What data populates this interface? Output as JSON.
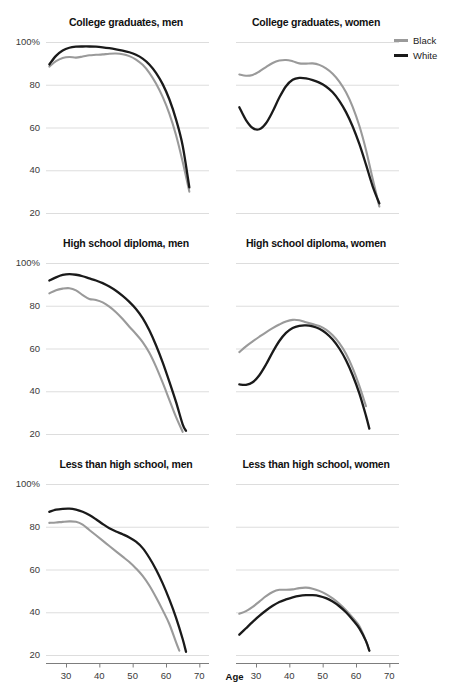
{
  "figure": {
    "xaxis_title": "Age",
    "legend": {
      "items": [
        {
          "label": "Black",
          "color": "#9a9a9a"
        },
        {
          "label": "White",
          "color": "#1a1a1a"
        }
      ]
    }
  },
  "chart_data": {
    "type": "line",
    "xlabel": "Age",
    "ylabel": "",
    "xlim": [
      24,
      72
    ],
    "ylim": [
      20,
      100
    ],
    "xticks": [
      30,
      40,
      50,
      60,
      70
    ],
    "xticklabels": [
      "30",
      "40",
      "50",
      "60",
      "70"
    ],
    "yticks": [
      20,
      40,
      60,
      80,
      100
    ],
    "yticklabels": [
      "20",
      "40",
      "60",
      "80",
      "100%"
    ],
    "grid": true,
    "legend_position": "top-right",
    "legend_entries": [
      "Black",
      "White"
    ],
    "colors": {
      "Black": "#9a9a9a",
      "White": "#1a1a1a"
    },
    "panel_layout": {
      "rows": 3,
      "cols": 2
    },
    "panels": [
      {
        "title": "College graduates, men",
        "row": 0,
        "col": 0,
        "series": [
          {
            "name": "Black",
            "x": [
              25,
              27,
              29,
              31,
              33,
              35,
              37,
              39,
              41,
              43,
              45,
              47,
              49,
              51,
              53,
              55,
              57,
              59,
              61,
              63,
              65,
              67
            ],
            "y": [
              88.5,
              91.0,
              92.5,
              93.0,
              92.7,
              93.2,
              93.8,
              94.0,
              94.2,
              94.5,
              94.6,
              94.3,
              93.4,
              91.8,
              89.3,
              85.6,
              80.6,
              74.3,
              66.5,
              56.5,
              44.0,
              30.0
            ]
          },
          {
            "name": "White",
            "x": [
              25,
              27,
              29,
              31,
              33,
              35,
              37,
              39,
              41,
              43,
              45,
              47,
              49,
              51,
              53,
              55,
              57,
              59,
              61,
              63,
              65,
              67
            ],
            "y": [
              89.5,
              93.5,
              96.0,
              97.3,
              97.8,
              97.9,
              97.9,
              97.8,
              97.5,
              97.1,
              96.6,
              96.0,
              95.2,
              94.0,
              92.2,
              89.5,
              85.6,
              80.3,
              73.2,
              63.8,
              51.5,
              32.0
            ]
          }
        ]
      },
      {
        "title": "College graduates, women",
        "row": 0,
        "col": 1,
        "series": [
          {
            "name": "Black",
            "x": [
              25,
              27,
              29,
              31,
              33,
              35,
              37,
              39,
              41,
              43,
              45,
              47,
              49,
              51,
              53,
              55,
              57,
              59,
              61,
              63,
              65,
              67
            ],
            "y": [
              84.8,
              84.2,
              84.6,
              86.2,
              88.3,
              90.2,
              91.3,
              91.6,
              91.0,
              90.0,
              89.9,
              90.0,
              89.3,
              87.7,
              85.2,
              81.5,
              76.5,
              69.7,
              60.8,
              49.5,
              36.0,
              23.0
            ]
          },
          {
            "name": "White",
            "x": [
              25,
              27,
              29,
              31,
              33,
              35,
              37,
              39,
              41,
              43,
              45,
              47,
              49,
              51,
              53,
              55,
              57,
              59,
              61,
              63,
              65,
              67
            ],
            "y": [
              69.5,
              63.5,
              59.8,
              59.2,
              62.0,
              67.5,
              74.0,
              79.3,
              82.3,
              83.2,
              83.0,
              82.2,
              81.0,
              79.2,
              76.5,
              72.5,
              67.2,
              60.5,
              52.3,
              42.6,
              32.5,
              24.5
            ]
          }
        ]
      },
      {
        "title": "High school diploma, men",
        "row": 1,
        "col": 0,
        "series": [
          {
            "name": "Black",
            "x": [
              25,
              27,
              29,
              31,
              33,
              35,
              37,
              39,
              41,
              43,
              45,
              47,
              49,
              51,
              53,
              55,
              57,
              59,
              61,
              63,
              65
            ],
            "y": [
              85.8,
              87.3,
              88.0,
              88.2,
              87.2,
              85.0,
              83.2,
              82.7,
              81.6,
              79.6,
              77.0,
              73.8,
              70.2,
              66.8,
              63.0,
              58.0,
              51.5,
              44.0,
              36.0,
              28.0,
              21.0
            ]
          },
          {
            "name": "White",
            "x": [
              25,
              27,
              29,
              31,
              33,
              35,
              37,
              39,
              41,
              43,
              45,
              47,
              49,
              51,
              53,
              55,
              57,
              59,
              61,
              63,
              65,
              66
            ],
            "y": [
              91.8,
              93.3,
              94.4,
              94.8,
              94.5,
              93.8,
              92.8,
              91.8,
              90.6,
              89.0,
              87.0,
              84.6,
              81.8,
              78.5,
              74.2,
              68.5,
              61.5,
              53.5,
              44.5,
              35.0,
              24.5,
              21.5
            ]
          }
        ]
      },
      {
        "title": "High school diploma, women",
        "row": 1,
        "col": 1,
        "series": [
          {
            "name": "Black",
            "x": [
              25,
              27,
              29,
              31,
              33,
              35,
              37,
              39,
              41,
              43,
              45,
              47,
              49,
              51,
              53,
              55,
              57,
              59,
              61,
              63
            ],
            "y": [
              58.3,
              61.0,
              63.3,
              65.5,
              67.6,
              69.5,
              71.2,
              72.6,
              73.4,
              73.2,
              72.3,
              71.4,
              70.5,
              68.8,
              66.2,
              62.5,
              57.5,
              50.8,
              42.5,
              33.0
            ]
          },
          {
            "name": "White",
            "x": [
              25,
              27,
              29,
              31,
              33,
              35,
              37,
              39,
              41,
              43,
              45,
              47,
              49,
              51,
              53,
              55,
              57,
              59,
              61,
              63,
              64
            ],
            "y": [
              43.2,
              43.0,
              44.2,
              47.5,
              52.5,
              58.3,
              63.5,
              67.3,
              69.6,
              70.6,
              70.8,
              70.3,
              69.2,
              67.2,
              64.2,
              60.0,
              54.5,
              47.5,
              39.0,
              28.5,
              22.5
            ]
          }
        ]
      },
      {
        "title": "Less than high school, men",
        "row": 2,
        "col": 0,
        "series": [
          {
            "name": "Black",
            "x": [
              25,
              27,
              29,
              31,
              33,
              35,
              37,
              39,
              41,
              43,
              45,
              47,
              49,
              51,
              53,
              55,
              57,
              59,
              61,
              63,
              64
            ],
            "y": [
              81.8,
              82.0,
              82.3,
              82.5,
              82.3,
              81.0,
              78.5,
              76.0,
              73.5,
              71.0,
              68.5,
              66.0,
              63.5,
              60.5,
              57.0,
              52.5,
              47.0,
              41.0,
              34.5,
              26.0,
              22.0
            ]
          },
          {
            "name": "White",
            "x": [
              25,
              27,
              29,
              31,
              33,
              35,
              37,
              39,
              41,
              43,
              45,
              47,
              49,
              51,
              53,
              55,
              57,
              59,
              61,
              63,
              65,
              66
            ],
            "y": [
              87.0,
              88.0,
              88.4,
              88.5,
              88.0,
              87.0,
              85.5,
              83.5,
              81.3,
              79.3,
              77.8,
              76.5,
              75.0,
              73.0,
              70.0,
              65.5,
              60.0,
              53.5,
              46.0,
              37.5,
              27.5,
              21.5
            ]
          }
        ]
      },
      {
        "title": "Less than high school, women",
        "row": 2,
        "col": 1,
        "series": [
          {
            "name": "Black",
            "x": [
              25,
              27,
              29,
              31,
              33,
              35,
              37,
              39,
              41,
              43,
              45,
              47,
              49,
              51,
              53,
              55,
              57,
              59,
              61,
              63,
              64
            ],
            "y": [
              39.3,
              40.5,
              42.5,
              45.0,
              47.5,
              49.5,
              50.5,
              50.5,
              50.7,
              51.3,
              51.5,
              51.0,
              50.0,
              48.5,
              46.5,
              44.0,
              41.0,
              37.5,
              33.5,
              26.5,
              22.0
            ]
          },
          {
            "name": "White",
            "x": [
              25,
              27,
              29,
              31,
              33,
              35,
              37,
              39,
              41,
              43,
              45,
              47,
              49,
              51,
              53,
              55,
              57,
              59,
              61,
              63,
              64
            ],
            "y": [
              29.5,
              32.5,
              35.5,
              38.3,
              40.8,
              43.0,
              44.8,
              46.0,
              47.0,
              47.7,
              48.0,
              48.0,
              47.6,
              46.6,
              45.0,
              42.8,
              40.0,
              36.5,
              32.5,
              26.5,
              22.0
            ]
          }
        ]
      }
    ]
  }
}
